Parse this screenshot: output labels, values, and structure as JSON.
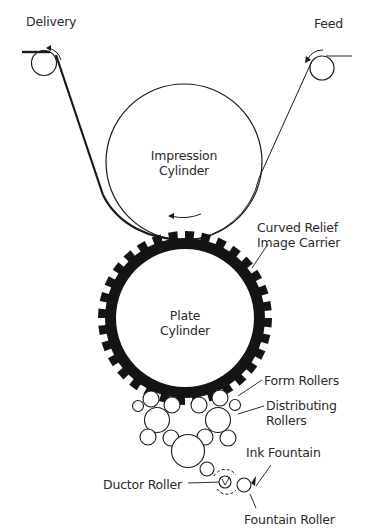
{
  "labels": {
    "delivery": "Delivery",
    "feed": "Feed",
    "impression_cylinder_line1": "Impression",
    "impression_cylinder_line2": "Cylinder",
    "curved_relief_line1": "Curved Relief",
    "curved_relief_line2": "Image Carrier",
    "plate_cylinder_line1": "Plate",
    "plate_cylinder_line2": "Cylinder",
    "form_rollers": "Form Rollers",
    "distributing_line1": "Distributing",
    "distributing_line2": "Rollers",
    "ink_fountain": "Ink Fountain",
    "ductor_roller": "Ductor Roller",
    "fountain_roller": "Fountain Roller"
  },
  "colors": {
    "stroke": "#1a1a1a",
    "plate": "#141414",
    "text": "#2a2a2a",
    "background": "#ffffff"
  }
}
